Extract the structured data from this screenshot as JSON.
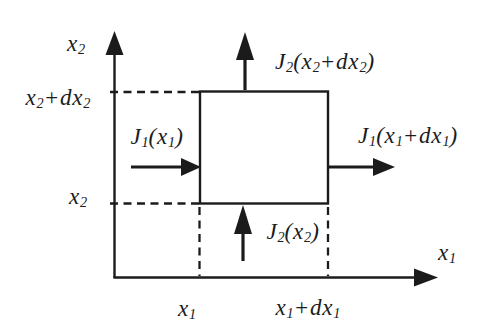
{
  "figure": {
    "background_color": "#ffffff",
    "ink_color": "#1b1b1b"
  },
  "axes": {
    "x2_axis_label": {
      "text": "x₂",
      "segs": [
        {
          "t": "x"
        },
        {
          "t": "2",
          "sub": true
        }
      ]
    },
    "x1_axis_label": {
      "text": "x₁",
      "segs": [
        {
          "t": "x"
        },
        {
          "t": "1",
          "sub": true
        }
      ]
    }
  },
  "ticks": {
    "x2_plus_dx2": {
      "text": "x₂+dx₂",
      "segs": [
        {
          "t": "x"
        },
        {
          "t": "2",
          "sub": true
        },
        {
          "t": "+dx"
        },
        {
          "t": "2",
          "sub": true
        }
      ]
    },
    "x2": {
      "text": "x₂",
      "segs": [
        {
          "t": "x"
        },
        {
          "t": "2",
          "sub": true
        }
      ]
    },
    "x1": {
      "text": "x₁",
      "segs": [
        {
          "t": "x"
        },
        {
          "t": "1",
          "sub": true
        }
      ]
    },
    "x1_plus_dx1": {
      "text": "x₁+dx₁",
      "segs": [
        {
          "t": "x"
        },
        {
          "t": "1",
          "sub": true
        },
        {
          "t": "+dx"
        },
        {
          "t": "1",
          "sub": true
        }
      ]
    }
  },
  "fluxes": {
    "j1_in": {
      "text": "J₁(x₁)",
      "segs": [
        {
          "t": "J"
        },
        {
          "t": "1",
          "sub": true
        },
        {
          "t": "(x"
        },
        {
          "t": "1",
          "sub": true
        },
        {
          "t": ")"
        }
      ]
    },
    "j1_out": {
      "text": "J₁(x₁+dx₁)",
      "segs": [
        {
          "t": "J"
        },
        {
          "t": "1",
          "sub": true
        },
        {
          "t": "(x"
        },
        {
          "t": "1",
          "sub": true
        },
        {
          "t": "+dx"
        },
        {
          "t": "1",
          "sub": true
        },
        {
          "t": ")"
        }
      ]
    },
    "j2_in": {
      "text": "J₂(x₂)",
      "segs": [
        {
          "t": "J"
        },
        {
          "t": "2",
          "sub": true
        },
        {
          "t": "(x"
        },
        {
          "t": "2",
          "sub": true
        },
        {
          "t": ")"
        }
      ]
    },
    "j2_out": {
      "text": "J₂(x₂+dx₂)",
      "segs": [
        {
          "t": "J"
        },
        {
          "t": "2",
          "sub": true
        },
        {
          "t": "(x"
        },
        {
          "t": "2",
          "sub": true
        },
        {
          "t": "+dx"
        },
        {
          "t": "2",
          "sub": true
        },
        {
          "t": ")"
        }
      ]
    }
  }
}
